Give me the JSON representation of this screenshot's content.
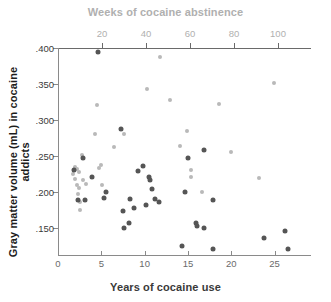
{
  "chart_data": {
    "type": "scatter",
    "title": "",
    "xlabel": "Years of cocaine use",
    "xlabel_top": "Weeks of cocaine abstinence",
    "ylabel": "Gray matter volume (mL) in cocaine addicts",
    "grid": false,
    "legend": "none",
    "xlim": [
      0,
      29.2
    ],
    "xlim_top": [
      0,
      115
    ],
    "ylim": [
      0.112,
      0.4
    ],
    "xticks": [
      0,
      5,
      10,
      15,
      20,
      25
    ],
    "xticklabels": [
      "0",
      "5",
      "10",
      "15",
      "20",
      "25"
    ],
    "xticks_top": [
      20,
      40,
      60,
      80,
      100
    ],
    "xticklabels_top": [
      "20",
      "40",
      "60",
      "80",
      "100"
    ],
    "yticks": [
      0.15,
      0.2,
      0.25,
      0.3,
      0.35,
      0.4
    ],
    "yticklabels": [
      ".150",
      ".200",
      ".250",
      ".300",
      ".350",
      ".400"
    ],
    "colors": {
      "light_series": "#b9b9b9",
      "dark_series": "#555555",
      "top_axis": "#b0b0b0",
      "bottom_axis": "#8a8a8a",
      "text_dark": "#1c1c1c"
    },
    "series": [
      {
        "name": "Weeks of cocaine abstinence",
        "color": "#b9b9b9",
        "axis": "top",
        "points": [
          {
            "x": 7.0,
            "y": 0.225
          },
          {
            "x": 7.5,
            "y": 0.235
          },
          {
            "x": 7.5,
            "y": 0.218
          },
          {
            "x": 8.5,
            "y": 0.232
          },
          {
            "x": 8.5,
            "y": 0.209
          },
          {
            "x": 9.0,
            "y": 0.197
          },
          {
            "x": 9.5,
            "y": 0.228
          },
          {
            "x": 9.5,
            "y": 0.205
          },
          {
            "x": 10.0,
            "y": 0.186
          },
          {
            "x": 10.0,
            "y": 0.175
          },
          {
            "x": 11.0,
            "y": 0.251
          },
          {
            "x": 11.5,
            "y": 0.216
          },
          {
            "x": 12.5,
            "y": 0.211
          },
          {
            "x": 17.0,
            "y": 0.28
          },
          {
            "x": 17.5,
            "y": 0.321
          },
          {
            "x": 18.5,
            "y": 0.233
          },
          {
            "x": 19.5,
            "y": 0.237
          },
          {
            "x": 20.0,
            "y": 0.209
          },
          {
            "x": 25.5,
            "y": 0.262
          },
          {
            "x": 30.0,
            "y": 0.28
          },
          {
            "x": 40.5,
            "y": 0.343
          },
          {
            "x": 46.5,
            "y": 0.388
          },
          {
            "x": 51.0,
            "y": 0.328
          },
          {
            "x": 55.5,
            "y": 0.263
          },
          {
            "x": 58.5,
            "y": 0.284
          },
          {
            "x": 60.5,
            "y": 0.23
          },
          {
            "x": 60.5,
            "y": 0.221
          },
          {
            "x": 65.5,
            "y": 0.2
          },
          {
            "x": 73.0,
            "y": 0.322
          },
          {
            "x": 78.5,
            "y": 0.255
          },
          {
            "x": 91.5,
            "y": 0.219
          },
          {
            "x": 98.0,
            "y": 0.351
          }
        ]
      },
      {
        "name": "Years of cocaine use",
        "color": "#555555",
        "axis": "bottom",
        "points": [
          {
            "x": 1.8,
            "y": 0.23
          },
          {
            "x": 2.3,
            "y": 0.188
          },
          {
            "x": 2.9,
            "y": 0.247
          },
          {
            "x": 3.1,
            "y": 0.188
          },
          {
            "x": 3.9,
            "y": 0.22
          },
          {
            "x": 4.6,
            "y": 0.395
          },
          {
            "x": 5.3,
            "y": 0.191
          },
          {
            "x": 5.5,
            "y": 0.2
          },
          {
            "x": 7.3,
            "y": 0.288
          },
          {
            "x": 7.5,
            "y": 0.173
          },
          {
            "x": 7.6,
            "y": 0.149
          },
          {
            "x": 8.2,
            "y": 0.156
          },
          {
            "x": 8.3,
            "y": 0.19
          },
          {
            "x": 8.8,
            "y": 0.178
          },
          {
            "x": 9.2,
            "y": 0.229
          },
          {
            "x": 9.8,
            "y": 0.236
          },
          {
            "x": 10.1,
            "y": 0.182
          },
          {
            "x": 10.5,
            "y": 0.22
          },
          {
            "x": 10.6,
            "y": 0.217
          },
          {
            "x": 10.8,
            "y": 0.204
          },
          {
            "x": 11.2,
            "y": 0.19
          },
          {
            "x": 11.7,
            "y": 0.186
          },
          {
            "x": 14.3,
            "y": 0.124
          },
          {
            "x": 14.6,
            "y": 0.199
          },
          {
            "x": 15.0,
            "y": 0.247
          },
          {
            "x": 15.9,
            "y": 0.156
          },
          {
            "x": 16.1,
            "y": 0.153
          },
          {
            "x": 16.9,
            "y": 0.15
          },
          {
            "x": 16.8,
            "y": 0.258
          },
          {
            "x": 17.9,
            "y": 0.188
          },
          {
            "x": 17.9,
            "y": 0.121
          },
          {
            "x": 23.8,
            "y": 0.135
          },
          {
            "x": 26.2,
            "y": 0.145
          },
          {
            "x": 26.5,
            "y": 0.12
          }
        ]
      }
    ]
  }
}
